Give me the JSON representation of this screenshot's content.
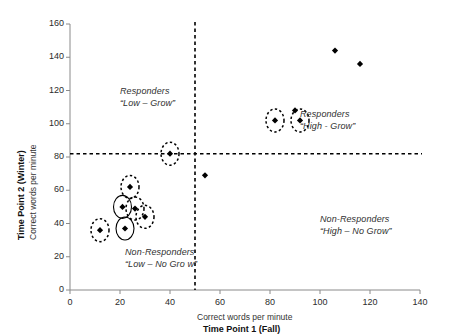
{
  "chart_data": {
    "type": "scatter",
    "title": "",
    "xlabel_line1": "Correct words per minute",
    "xlabel_line2": "Time Point 1 (Fall)",
    "ylabel_line1": "Time Point 2 (Winter)",
    "ylabel_line2": "Correct words per minute",
    "xlim": [
      0,
      140
    ],
    "ylim": [
      0,
      160
    ],
    "xticks": [
      0,
      20,
      40,
      60,
      80,
      100,
      120,
      140
    ],
    "yticks": [
      0,
      20,
      40,
      60,
      80,
      100,
      120,
      140,
      160
    ],
    "grid": false,
    "legend": "none",
    "reference_lines": [
      {
        "axis": "x",
        "value": 50,
        "style": "dashed",
        "color": "#000000"
      },
      {
        "axis": "y",
        "value": 82,
        "style": "dashed",
        "color": "#000000"
      }
    ],
    "marker": "diamond",
    "marker_color": "#000000",
    "points": [
      {
        "x": 12,
        "y": 36,
        "circled": "dashed"
      },
      {
        "x": 21,
        "y": 50,
        "circled": "solid"
      },
      {
        "x": 22,
        "y": 37,
        "circled": "solid"
      },
      {
        "x": 24,
        "y": 62,
        "circled": "dashed"
      },
      {
        "x": 26,
        "y": 49,
        "circled": "dashed"
      },
      {
        "x": 30,
        "y": 44,
        "circled": "dashed"
      },
      {
        "x": 40,
        "y": 82,
        "circled": "dashed"
      },
      {
        "x": 54,
        "y": 69,
        "circled": "none"
      },
      {
        "x": 82,
        "y": 102,
        "circled": "dashed"
      },
      {
        "x": 90,
        "y": 108,
        "circled": "none"
      },
      {
        "x": 92,
        "y": 102,
        "circled": "dashed"
      },
      {
        "x": 106,
        "y": 144,
        "circled": "none"
      },
      {
        "x": 116,
        "y": 136,
        "circled": "none"
      }
    ],
    "annotations": [
      {
        "name": "responders-low-grow",
        "line1": "Responders",
        "line2": "“Low  –  Grow”",
        "x": 20,
        "y": 119
      },
      {
        "name": "responders-high-grow",
        "line1": "Responders",
        "line2": "“High - Grow”",
        "x": 92,
        "y": 105
      },
      {
        "name": "non-responders-low-no-grow",
        "line1": "Non-Responders",
        "line2": "“Low  –  No Gro w”",
        "x": 22,
        "y": 22
      },
      {
        "name": "non-responders-high-no-grow",
        "line1": "Non-Responders",
        "line2": "“High – No Grow”",
        "x": 100,
        "y": 42
      }
    ]
  }
}
